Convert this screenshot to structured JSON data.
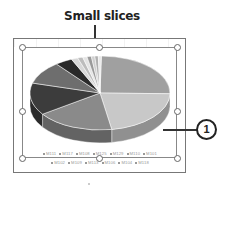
{
  "annotation": {
    "title": "Small slices",
    "callout_number": "1"
  },
  "chart_data": {
    "type": "pie",
    "style": "3d-pie",
    "title": "",
    "legend_position": "bottom",
    "categories": [
      "M111",
      "M117",
      "M108",
      "M125",
      "M129",
      "M110",
      "M101",
      "M102",
      "M109",
      "M113",
      "M106",
      "M104",
      "M118"
    ],
    "values": [
      25,
      22,
      18,
      14,
      10,
      4,
      1.5,
      1.2,
      1,
      1,
      0.8,
      0.8,
      0.7
    ],
    "colors": [
      "#a0a0a0",
      "#c8c8c8",
      "#8a8a8a",
      "#3c3c3c",
      "#6e6e6e",
      "#2a2a2a",
      "#d8d8d8",
      "#bdbdbd",
      "#e4e4e4",
      "#9a9a9a",
      "#cfcfcf",
      "#b0b0b0",
      "#e8e8e8"
    ]
  },
  "legend": {
    "row1": [
      "M111",
      "M117",
      "M108",
      "M125",
      "M129",
      "M110",
      "M101"
    ],
    "row2": [
      "M102",
      "M109",
      "M113",
      "M106",
      "M104",
      "M118"
    ]
  }
}
